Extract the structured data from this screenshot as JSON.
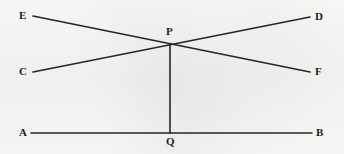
{
  "figure": {
    "background_color": "#f8f8f7",
    "stroke_color": "#262626",
    "label_color": "#1d1d1d",
    "stroke_width": 1.6,
    "width": 344,
    "height": 154,
    "points": {
      "A": {
        "label": "A",
        "x": 31,
        "y": 133,
        "label_x": 19,
        "label_y": 127
      },
      "B": {
        "label": "B",
        "x": 312,
        "y": 133,
        "label_x": 316,
        "label_y": 127
      },
      "C": {
        "label": "C",
        "x": 33,
        "y": 72,
        "label_x": 19,
        "label_y": 66
      },
      "D": {
        "label": "D",
        "x": 310,
        "y": 17,
        "label_x": 315,
        "label_y": 11
      },
      "E": {
        "label": "E",
        "x": 33,
        "y": 16,
        "label_x": 19,
        "label_y": 10
      },
      "F": {
        "label": "F",
        "x": 310,
        "y": 72,
        "label_x": 315,
        "label_y": 66
      },
      "P": {
        "label": "P",
        "x": 170,
        "y": 44,
        "label_x": 166,
        "label_y": 26
      },
      "Q": {
        "label": "Q",
        "x": 170,
        "y": 133,
        "label_x": 166,
        "label_y": 136
      }
    },
    "segments": [
      {
        "name": "segment-AB",
        "from": "A",
        "to": "B",
        "description": "horizontal base line A to B"
      },
      {
        "name": "segment-EF",
        "from": "E",
        "to": "F",
        "description": "line from upper-left E through P to lower-right F"
      },
      {
        "name": "segment-CD",
        "from": "C",
        "to": "D",
        "description": "line from lower-left C through P to upper-right D"
      },
      {
        "name": "segment-PQ",
        "from": "P",
        "to": "Q",
        "description": "vertical segment from P down to Q on AB"
      }
    ]
  }
}
